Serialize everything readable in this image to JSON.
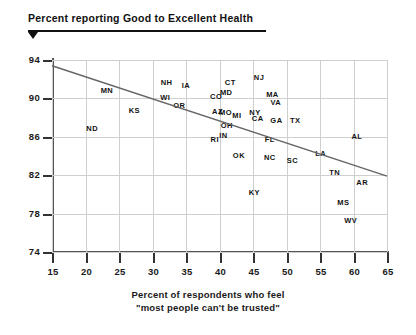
{
  "chart_data": {
    "type": "scatter",
    "title": "Percent reporting Good to Excellent Health",
    "xlabel_line1": "Percent of respondents who feel",
    "xlabel_line2": "\"most people can't be trusted\"",
    "ylabel": "Percent reporting Good to Excellent Health",
    "xlim": [
      15,
      65
    ],
    "ylim": [
      74,
      94
    ],
    "xticks": [
      15,
      20,
      25,
      30,
      35,
      40,
      45,
      50,
      55,
      60,
      65
    ],
    "yticks": [
      74,
      78,
      82,
      86,
      90,
      94
    ],
    "grid": true,
    "legend": "none",
    "point_style": "text-label",
    "trendline": {
      "type": "linear",
      "x_start": 15,
      "y_start": 93.4,
      "x_end": 65,
      "y_end": 81.9,
      "color": "#666666"
    },
    "points": [
      {
        "label": "ND",
        "x": 21.0,
        "y": 86.9
      },
      {
        "label": "MN",
        "x": 23.2,
        "y": 90.9
      },
      {
        "label": "KS",
        "x": 27.3,
        "y": 88.8
      },
      {
        "label": "NH",
        "x": 32.1,
        "y": 91.7
      },
      {
        "label": "IA",
        "x": 35.0,
        "y": 91.4
      },
      {
        "label": "WI",
        "x": 31.9,
        "y": 90.1
      },
      {
        "label": "OR",
        "x": 34.0,
        "y": 89.3
      },
      {
        "label": "CT",
        "x": 41.6,
        "y": 91.7
      },
      {
        "label": "MD",
        "x": 41.0,
        "y": 90.7
      },
      {
        "label": "CO",
        "x": 39.5,
        "y": 90.3
      },
      {
        "label": "AZ",
        "x": 39.7,
        "y": 88.7
      },
      {
        "label": "NJ",
        "x": 45.9,
        "y": 92.2
      },
      {
        "label": "MA",
        "x": 47.9,
        "y": 90.5
      },
      {
        "label": "VA",
        "x": 48.4,
        "y": 89.6
      },
      {
        "label": "MI",
        "x": 42.6,
        "y": 88.3
      },
      {
        "label": "NY",
        "x": 45.3,
        "y": 88.6
      },
      {
        "label": "CA",
        "x": 45.7,
        "y": 88.0
      },
      {
        "label": "GA",
        "x": 48.5,
        "y": 87.7
      },
      {
        "label": "TX",
        "x": 51.3,
        "y": 87.7
      },
      {
        "label": "OH",
        "x": 41.1,
        "y": 87.2
      },
      {
        "label": "IN",
        "x": 40.6,
        "y": 86.2
      },
      {
        "label": "RI",
        "x": 39.3,
        "y": 85.8
      },
      {
        "label": "FL",
        "x": 47.5,
        "y": 85.8
      },
      {
        "label": "MO",
        "x": 40.9,
        "y": 88.6
      },
      {
        "label": "OK",
        "x": 42.9,
        "y": 84.1
      },
      {
        "label": "NC",
        "x": 47.5,
        "y": 83.9
      },
      {
        "label": "SC",
        "x": 50.9,
        "y": 83.6
      },
      {
        "label": "LA",
        "x": 55.1,
        "y": 84.3
      },
      {
        "label": "AL",
        "x": 60.5,
        "y": 86.1
      },
      {
        "label": "TN",
        "x": 57.2,
        "y": 82.3
      },
      {
        "label": "AR",
        "x": 61.3,
        "y": 81.3
      },
      {
        "label": "KY",
        "x": 45.2,
        "y": 80.3
      },
      {
        "label": "MS",
        "x": 58.5,
        "y": 79.2
      },
      {
        "label": "WV",
        "x": 59.6,
        "y": 77.3
      }
    ]
  },
  "axis": {
    "x_caption_line1": "Percent of respondents who feel",
    "x_caption_line2": "\"most people can't be trusted\"",
    "title": "Percent reporting Good to Excellent Health"
  }
}
